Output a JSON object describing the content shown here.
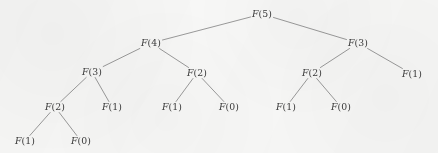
{
  "figure": {
    "kind": "recursion-tree",
    "caption_text": "",
    "background_color": "#f7f7f6",
    "edge_color": "#8e8e8e",
    "label_color": "#3a3a3a",
    "width": 438,
    "height": 153
  },
  "chart_data": {
    "type": "diagram",
    "title": "",
    "subtype": "binary recursion tree for Fibonacci F(5)",
    "nodes": [
      {
        "id": "n0",
        "label": "F(5)",
        "func": "F",
        "arg": "(5)",
        "x": 262,
        "y": 14,
        "depth": 0
      },
      {
        "id": "n1",
        "label": "F(4)",
        "func": "F",
        "arg": "(4)",
        "x": 151,
        "y": 43,
        "depth": 1
      },
      {
        "id": "n2",
        "label": "F(3)",
        "func": "F",
        "arg": "(3)",
        "x": 358,
        "y": 43,
        "depth": 1
      },
      {
        "id": "n3",
        "label": "F(3)",
        "func": "F",
        "arg": "(3)",
        "x": 92,
        "y": 72,
        "depth": 2
      },
      {
        "id": "n4",
        "label": "F(2)",
        "func": "F",
        "arg": "(2)",
        "x": 197,
        "y": 73,
        "depth": 2
      },
      {
        "id": "n5",
        "label": "F(2)",
        "func": "F",
        "arg": "(2)",
        "x": 312,
        "y": 73,
        "depth": 2
      },
      {
        "id": "n6",
        "label": "F(1)",
        "func": "F",
        "arg": "(1)",
        "x": 412,
        "y": 74,
        "depth": 2
      },
      {
        "id": "n7",
        "label": "F(2)",
        "func": "F",
        "arg": "(2)",
        "x": 55,
        "y": 107,
        "depth": 3
      },
      {
        "id": "n8",
        "label": "F(1)",
        "func": "F",
        "arg": "(1)",
        "x": 112,
        "y": 107,
        "depth": 3
      },
      {
        "id": "n9",
        "label": "F(1)",
        "func": "F",
        "arg": "(1)",
        "x": 172,
        "y": 107,
        "depth": 3
      },
      {
        "id": "n10",
        "label": "F(0)",
        "func": "F",
        "arg": "(0)",
        "x": 229,
        "y": 107,
        "depth": 3
      },
      {
        "id": "n11",
        "label": "F(1)",
        "func": "F",
        "arg": "(1)",
        "x": 286,
        "y": 107,
        "depth": 3
      },
      {
        "id": "n12",
        "label": "F(0)",
        "func": "F",
        "arg": "(0)",
        "x": 341,
        "y": 107,
        "depth": 3
      },
      {
        "id": "n13",
        "label": "F(1)",
        "func": "F",
        "arg": "(1)",
        "x": 25,
        "y": 141,
        "depth": 4
      },
      {
        "id": "n14",
        "label": "F(0)",
        "func": "F",
        "arg": "(0)",
        "x": 81,
        "y": 141,
        "depth": 4
      }
    ],
    "edges": [
      {
        "from": "n0",
        "to": "n1"
      },
      {
        "from": "n0",
        "to": "n2"
      },
      {
        "from": "n1",
        "to": "n3"
      },
      {
        "from": "n1",
        "to": "n4"
      },
      {
        "from": "n2",
        "to": "n5"
      },
      {
        "from": "n2",
        "to": "n6"
      },
      {
        "from": "n3",
        "to": "n7"
      },
      {
        "from": "n3",
        "to": "n8"
      },
      {
        "from": "n4",
        "to": "n9"
      },
      {
        "from": "n4",
        "to": "n10"
      },
      {
        "from": "n5",
        "to": "n11"
      },
      {
        "from": "n5",
        "to": "n12"
      },
      {
        "from": "n7",
        "to": "n13"
      },
      {
        "from": "n7",
        "to": "n14"
      }
    ]
  }
}
